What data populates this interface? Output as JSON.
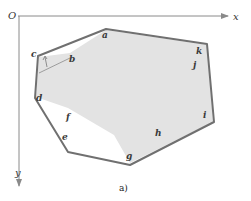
{
  "figure": {
    "caption": "a)",
    "axes": {
      "origin_label": "O",
      "x_label": "x",
      "y_label": "y"
    },
    "points": {
      "a": "a",
      "b": "b",
      "c": "c",
      "d": "d",
      "e": "e",
      "f": "f",
      "g": "g",
      "h": "h",
      "i": "i",
      "j": "j",
      "k": "k"
    },
    "colors": {
      "hull_stroke": "#707070",
      "region_fill": "#e3e3e3",
      "axis": "#8a8a8a"
    }
  }
}
